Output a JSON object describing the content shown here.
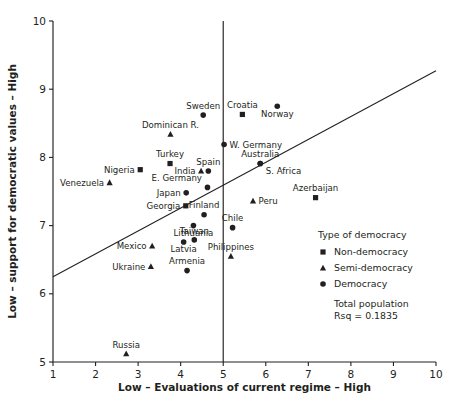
{
  "chart_data": {
    "type": "scatter",
    "title": "",
    "xlabel": "Low – Evaluations of current regime – High",
    "ylabel": "Low – support for democratic values – High",
    "xlim": [
      1,
      10
    ],
    "ylim": [
      5,
      10
    ],
    "xticks": [
      "1",
      "2",
      "3",
      "4",
      "5",
      "6",
      "7",
      "8",
      "9",
      "10"
    ],
    "yticks": [
      "5",
      "6",
      "7",
      "8",
      "9",
      "10"
    ],
    "grid": false,
    "legend_position": "inside-bottom-right",
    "reference_line_x": 5,
    "trend_line": {
      "x0": 1,
      "y0": 6.25,
      "x1": 10,
      "y1": 9.27
    },
    "series": [
      {
        "name": "Non-democracy",
        "marker": "square",
        "points": [
          {
            "label": "Croatia",
            "x": 5.45,
            "y": 8.63,
            "lx": "mid",
            "ly": "above"
          },
          {
            "label": "Nigeria",
            "x": 3.05,
            "y": 7.82,
            "lx": "left",
            "ly": "inline"
          },
          {
            "label": "Turkey",
            "x": 3.75,
            "y": 7.91,
            "lx": "mid",
            "ly": "above"
          },
          {
            "label": "Georgia",
            "x": 4.12,
            "y": 7.29,
            "lx": "left",
            "ly": "inline"
          },
          {
            "label": "Azerbaijan",
            "x": 7.17,
            "y": 7.41,
            "lx": "mid",
            "ly": "above"
          }
        ]
      },
      {
        "name": "Semi-democracy",
        "marker": "triangle",
        "points": [
          {
            "label": "Dominican R.",
            "x": 3.76,
            "y": 8.34,
            "lx": "mid",
            "ly": "above"
          },
          {
            "label": "Venezuela",
            "x": 2.33,
            "y": 7.63,
            "lx": "left",
            "ly": "inline"
          },
          {
            "label": "India",
            "x": 4.48,
            "y": 7.8,
            "lx": "left",
            "ly": "inline"
          },
          {
            "label": "Peru",
            "x": 5.7,
            "y": 7.36,
            "lx": "right",
            "ly": "inline"
          },
          {
            "label": "Mexico",
            "x": 3.33,
            "y": 6.7,
            "lx": "left",
            "ly": "inline"
          },
          {
            "label": "Ukraine",
            "x": 3.3,
            "y": 6.4,
            "lx": "left",
            "ly": "inline"
          },
          {
            "label": "Philippines",
            "x": 5.18,
            "y": 6.55,
            "lx": "mid",
            "ly": "above"
          },
          {
            "label": "Russia",
            "x": 2.72,
            "y": 5.12,
            "lx": "mid",
            "ly": "above"
          }
        ]
      },
      {
        "name": "Democracy",
        "marker": "circle",
        "points": [
          {
            "label": "Norway",
            "x": 6.27,
            "y": 8.75,
            "lx": "mid",
            "ly": "below"
          },
          {
            "label": "Sweden",
            "x": 4.53,
            "y": 8.62,
            "lx": "mid",
            "ly": "above"
          },
          {
            "label": "W. Germany",
            "x": 5.02,
            "y": 8.19,
            "lx": "right",
            "ly": "inline"
          },
          {
            "label": "Australia",
            "x": 5.87,
            "y": 7.91,
            "lx": "mid",
            "ly": "above"
          },
          {
            "label": "Spain",
            "x": 4.65,
            "y": 7.8,
            "lx": "mid",
            "ly": "above"
          },
          {
            "label": "S. Africa",
            "x": 5.87,
            "y": 7.91,
            "lx": "right",
            "ly": "below"
          },
          {
            "label": "E. Germany",
            "x": 4.63,
            "y": 7.56,
            "lx": "left",
            "ly": "above"
          },
          {
            "label": "Japan",
            "x": 4.13,
            "y": 7.48,
            "lx": "left",
            "ly": "inline"
          },
          {
            "label": "Finland",
            "x": 4.55,
            "y": 7.16,
            "lx": "mid",
            "ly": "above"
          },
          {
            "label": "Chile",
            "x": 5.22,
            "y": 6.97,
            "lx": "mid",
            "ly": "above"
          },
          {
            "label": "Lithuania",
            "x": 4.3,
            "y": 7.0,
            "lx": "mid",
            "ly": "below"
          },
          {
            "label": "Taiwan",
            "x": 4.32,
            "y": 6.79,
            "lx": "mid",
            "ly": "above"
          },
          {
            "label": "Latvia",
            "x": 4.07,
            "y": 6.76,
            "lx": "mid",
            "ly": "below"
          },
          {
            "label": "Armenia",
            "x": 4.15,
            "y": 6.34,
            "lx": "mid",
            "ly": "above"
          }
        ]
      }
    ]
  },
  "legend": {
    "title": "Type of democracy",
    "entries": [
      {
        "label": "Non-democracy",
        "marker": "square"
      },
      {
        "label": "Semi-democracy",
        "marker": "triangle"
      },
      {
        "label": "Democracy",
        "marker": "circle"
      }
    ],
    "note_line1": "Total population",
    "note_line2": "Rsq = 0.1835"
  }
}
